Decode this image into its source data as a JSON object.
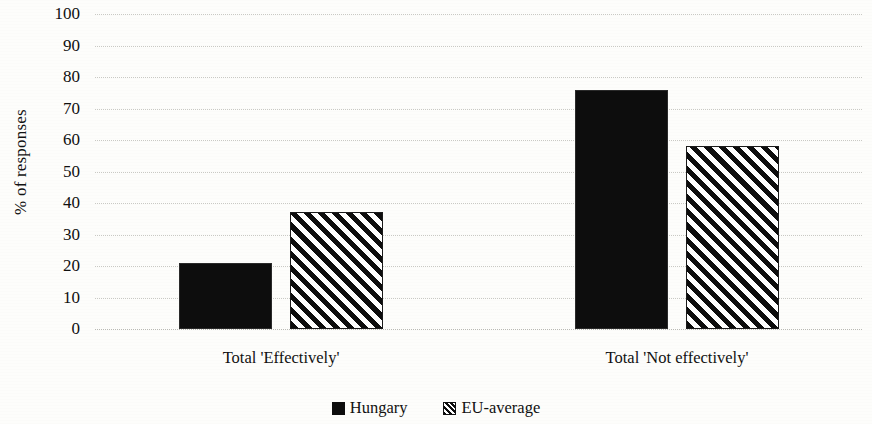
{
  "chart_data": {
    "type": "bar",
    "title": "",
    "xlabel": "",
    "ylabel": "% of responses",
    "ylim": [
      0,
      100
    ],
    "ytick_step": 10,
    "yticks": [
      100,
      90,
      80,
      70,
      60,
      50,
      40,
      30,
      20,
      10,
      0
    ],
    "grid": true,
    "legend_position": "bottom-center",
    "categories": [
      "Total 'Effectively'",
      "Total 'Not effectively'"
    ],
    "series": [
      {
        "name": "Hungary",
        "pattern": "solid",
        "color": "#0d0d0d",
        "values": [
          21,
          76
        ]
      },
      {
        "name": "EU-average",
        "pattern": "diagonal-stripes",
        "color": "#0d0d0d",
        "values": [
          37,
          58
        ]
      }
    ]
  },
  "axis": {
    "y_title": "% of responses"
  },
  "legend": {
    "items": [
      {
        "label": "Hungary",
        "swatch": "solid-square-icon"
      },
      {
        "label": "EU-average",
        "swatch": "striped-square-icon"
      }
    ]
  }
}
